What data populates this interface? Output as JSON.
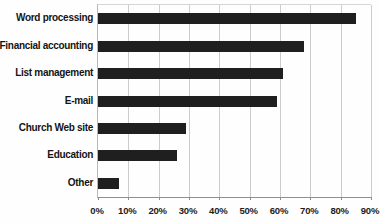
{
  "chart_data": {
    "type": "bar",
    "orientation": "horizontal",
    "title": "",
    "xlabel": "",
    "ylabel": "",
    "categories": [
      "Word processing",
      "Financial accounting",
      "List management",
      "E-mail",
      "Church Web site",
      "Education",
      "Other"
    ],
    "values": [
      85,
      68,
      61,
      59,
      29,
      26,
      7
    ],
    "value_unit": "%",
    "xlim": [
      0,
      90
    ],
    "x_ticks": [
      "0%",
      "10%",
      "20%",
      "30%",
      "40%",
      "50%",
      "60%",
      "70%",
      "80%",
      "90%"
    ],
    "x_tick_values": [
      0,
      10,
      20,
      30,
      40,
      50,
      60,
      70,
      80,
      90
    ],
    "grid": true,
    "legend": "none",
    "bar_color": "#1f1f1f",
    "gridline_color": "#cccccc",
    "axis_color": "#8f8f8f",
    "label_color": "#141414",
    "background": "#fefefe"
  }
}
